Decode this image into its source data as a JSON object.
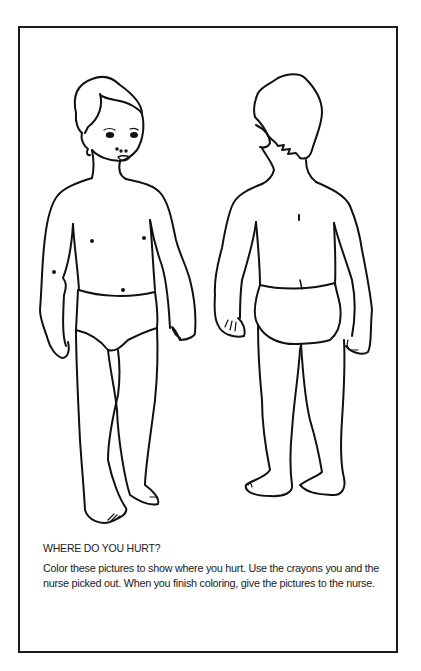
{
  "page": {
    "title": "WHERE DO YOU HURT?",
    "instructions": "Color these pictures to show where you hurt. Use the crayons you and the nurse picked out. When you finish coloring, give the pictures to the nurse."
  },
  "figures": [
    {
      "name": "child-front-view",
      "label": "Child body outline, front view"
    },
    {
      "name": "child-back-view",
      "label": "Child body outline, back view"
    }
  ],
  "colors": {
    "line": "#111111",
    "background": "#ffffff"
  }
}
